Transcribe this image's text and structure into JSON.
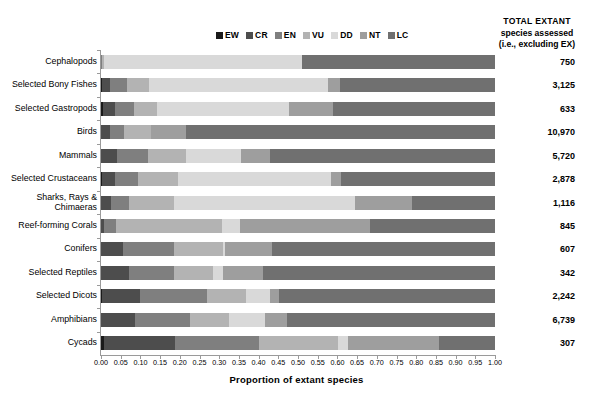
{
  "legend": {
    "items": [
      {
        "label": "EW",
        "color": "#1a1a1a"
      },
      {
        "label": "CR",
        "color": "#4d4d4d"
      },
      {
        "label": "EN",
        "color": "#7f7f7f"
      },
      {
        "label": "VU",
        "color": "#b3b3b3"
      },
      {
        "label": "DD",
        "color": "#d9d9d9"
      },
      {
        "label": "NT",
        "color": "#9e9e9e"
      },
      {
        "label": "LC",
        "color": "#707070"
      }
    ]
  },
  "total_header": {
    "line1": "TOTAL EXTANT",
    "line2": "species assessed",
    "line3": "(i.e., excluding EX)"
  },
  "xaxis": {
    "title": "Proportion of extant species",
    "ticks": [
      "0.00",
      "0.05",
      "0.10",
      "0.15",
      "0.20",
      "0.25",
      "0.30",
      "0.35",
      "0.40",
      "0.45",
      "0.50",
      "0.55",
      "0.60",
      "0.65",
      "0.70",
      "0.75",
      "0.80",
      "0.85",
      "0.90",
      "0.95",
      "1.00"
    ],
    "min": 0.0,
    "max": 1.0
  },
  "chart_data": {
    "type": "bar",
    "orientation": "horizontal",
    "stacked": true,
    "normalized": true,
    "title": "",
    "xlabel": "Proportion of extant species",
    "ylabel": "",
    "xlim": [
      0.0,
      1.0
    ],
    "grid": false,
    "legend_position": "top",
    "series": [
      {
        "name": "EW",
        "color": "#1a1a1a"
      },
      {
        "name": "CR",
        "color": "#4d4d4d"
      },
      {
        "name": "EN",
        "color": "#7f7f7f"
      },
      {
        "name": "VU",
        "color": "#b3b3b3"
      },
      {
        "name": "DD",
        "color": "#d9d9d9"
      },
      {
        "name": "NT",
        "color": "#9e9e9e"
      },
      {
        "name": "LC",
        "color": "#707070"
      }
    ],
    "categories": [
      "Cephalopods",
      "Selected Bony Fishes",
      "Selected Gastropods",
      "Birds",
      "Mammals",
      "Selected Crustaceans",
      "Sharks, Rays & Chimaeras",
      "Reef-forming Corals",
      "Conifers",
      "Selected Reptiles",
      "Selected Dicots",
      "Amphibians",
      "Cycads"
    ],
    "totals": [
      "750",
      "3,125",
      "633",
      "10,970",
      "5,720",
      "2,878",
      "1,116",
      "845",
      "607",
      "342",
      "2,242",
      "6,739",
      "307"
    ],
    "rows": [
      {
        "category": "Cephalopods",
        "total": "750",
        "values": {
          "EW": 0.0,
          "CR": 0.0,
          "EN": 0.003,
          "VU": 0.004,
          "DD": 0.503,
          "NT": 0.0,
          "LC": 0.49
        }
      },
      {
        "category": "Selected Bony Fishes",
        "total": "3,125",
        "values": {
          "EW": 0.002,
          "CR": 0.022,
          "EN": 0.043,
          "VU": 0.055,
          "DD": 0.455,
          "NT": 0.03,
          "LC": 0.393
        }
      },
      {
        "category": "Selected Gastropods",
        "total": "633",
        "values": {
          "EW": 0.005,
          "CR": 0.03,
          "EN": 0.05,
          "VU": 0.058,
          "DD": 0.335,
          "NT": 0.11,
          "LC": 0.412
        }
      },
      {
        "category": "Birds",
        "total": "10,970",
        "values": {
          "EW": 0.001,
          "CR": 0.022,
          "EN": 0.036,
          "VU": 0.068,
          "DD": 0.001,
          "NT": 0.088,
          "LC": 0.784
        }
      },
      {
        "category": "Mammals",
        "total": "5,720",
        "values": {
          "EW": 0.001,
          "CR": 0.039,
          "EN": 0.08,
          "VU": 0.095,
          "DD": 0.14,
          "NT": 0.075,
          "LC": 0.57
        }
      },
      {
        "category": "Selected Crustaceans",
        "total": "2,878",
        "values": {
          "EW": 0.002,
          "CR": 0.033,
          "EN": 0.06,
          "VU": 0.1,
          "DD": 0.39,
          "NT": 0.025,
          "LC": 0.39
        }
      },
      {
        "category": "Sharks, Rays & Chimaeras",
        "total": "1,116",
        "values": {
          "EW": 0.0,
          "CR": 0.025,
          "EN": 0.045,
          "VU": 0.115,
          "DD": 0.46,
          "NT": 0.145,
          "LC": 0.21
        }
      },
      {
        "category": "Reef-forming Corals",
        "total": "845",
        "values": {
          "EW": 0.0,
          "CR": 0.008,
          "EN": 0.03,
          "VU": 0.27,
          "DD": 0.045,
          "NT": 0.33,
          "LC": 0.317
        }
      },
      {
        "category": "Conifers",
        "total": "607",
        "values": {
          "EW": 0.0,
          "CR": 0.055,
          "EN": 0.13,
          "VU": 0.125,
          "DD": 0.005,
          "NT": 0.12,
          "LC": 0.565
        }
      },
      {
        "category": "Selected Reptiles",
        "total": "342",
        "values": {
          "EW": 0.0,
          "CR": 0.07,
          "EN": 0.115,
          "VU": 0.1,
          "DD": 0.025,
          "NT": 0.1,
          "LC": 0.59
        }
      },
      {
        "category": "Selected Dicots",
        "total": "2,242",
        "values": {
          "EW": 0.003,
          "CR": 0.095,
          "EN": 0.17,
          "VU": 0.1,
          "DD": 0.06,
          "NT": 0.025,
          "LC": 0.547
        }
      },
      {
        "category": "Amphibians",
        "total": "6,739",
        "values": {
          "EW": 0.001,
          "CR": 0.085,
          "EN": 0.14,
          "VU": 0.1,
          "DD": 0.09,
          "NT": 0.055,
          "LC": 0.529
        }
      },
      {
        "category": "Cycads",
        "total": "307",
        "values": {
          "EW": 0.007,
          "CR": 0.18,
          "EN": 0.215,
          "VU": 0.2,
          "DD": 0.025,
          "NT": 0.23,
          "LC": 0.143
        }
      }
    ]
  }
}
